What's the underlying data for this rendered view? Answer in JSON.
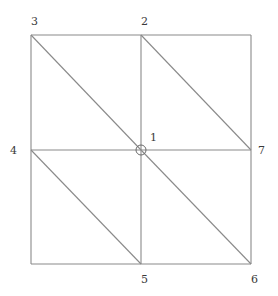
{
  "diagram": {
    "type": "triangular-mesh",
    "nodes": [
      {
        "id": "1",
        "label": "1",
        "x": 141,
        "y": 150,
        "label_x": 150,
        "label_y": 141,
        "marked": true
      },
      {
        "id": "2",
        "label": "2",
        "x": 141,
        "y": 35,
        "label_x": 141,
        "label_y": 25,
        "marked": false
      },
      {
        "id": "3",
        "label": "3",
        "x": 31,
        "y": 35,
        "label_x": 31,
        "label_y": 25,
        "marked": false
      },
      {
        "id": "4",
        "label": "4",
        "x": 31,
        "y": 150,
        "label_x": 10,
        "label_y": 154,
        "marked": false
      },
      {
        "id": "5",
        "label": "5",
        "x": 141,
        "y": 264,
        "label_x": 141,
        "label_y": 283,
        "marked": false
      },
      {
        "id": "6",
        "label": "6",
        "x": 251,
        "y": 264,
        "label_x": 251,
        "label_y": 283,
        "marked": false
      },
      {
        "id": "7",
        "label": "7",
        "x": 251,
        "y": 150,
        "label_x": 258,
        "label_y": 154,
        "marked": false
      }
    ],
    "unlabeled_corners": [
      {
        "id": "top-right",
        "x": 251,
        "y": 35
      },
      {
        "id": "bottom-left",
        "x": 31,
        "y": 264
      }
    ],
    "edges": [
      {
        "from": "3",
        "to": "2"
      },
      {
        "from": "2",
        "to": "top-right"
      },
      {
        "from": "top-right",
        "to": "7"
      },
      {
        "from": "7",
        "to": "6"
      },
      {
        "from": "6",
        "to": "5"
      },
      {
        "from": "5",
        "to": "bottom-left"
      },
      {
        "from": "bottom-left",
        "to": "4"
      },
      {
        "from": "4",
        "to": "3"
      },
      {
        "from": "2",
        "to": "1"
      },
      {
        "from": "1",
        "to": "5"
      },
      {
        "from": "4",
        "to": "1"
      },
      {
        "from": "1",
        "to": "7"
      },
      {
        "from": "3",
        "to": "1"
      },
      {
        "from": "2",
        "to": "7"
      },
      {
        "from": "4",
        "to": "5"
      },
      {
        "from": "1",
        "to": "6"
      }
    ],
    "highlighted_node": "1",
    "colors": {
      "edge": "#8a8a8a",
      "label": "#3a3a3a",
      "background": "#ffffff"
    }
  }
}
